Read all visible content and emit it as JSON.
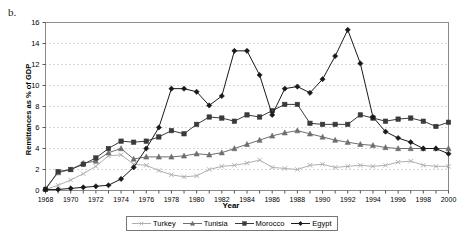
{
  "panel_label": "b.",
  "chart_data": {
    "type": "line",
    "title": "",
    "xlabel": "Year",
    "ylabel": "Remittances as % of GDP",
    "xlim": [
      1968,
      2000
    ],
    "ylim": [
      0,
      16
    ],
    "ytick_step": 2,
    "xtick_step": 2,
    "grid": true,
    "grid_style": "dotted-horizontal",
    "legend_position": "bottom-center",
    "x": [
      1968,
      1969,
      1970,
      1971,
      1972,
      1973,
      1974,
      1975,
      1976,
      1977,
      1978,
      1979,
      1980,
      1981,
      1982,
      1983,
      1984,
      1985,
      1986,
      1987,
      1988,
      1989,
      1990,
      1991,
      1992,
      1993,
      1994,
      1995,
      1996,
      1997,
      1998,
      1999,
      2000
    ],
    "ytick_labels": [
      "0",
      "2",
      "4",
      "6",
      "8",
      "10",
      "12",
      "14",
      "16"
    ],
    "xtick_labels": [
      "1968",
      "1970",
      "1972",
      "1974",
      "1976",
      "1978",
      "1980",
      "1982",
      "1984",
      "1986",
      "1988",
      "1990",
      "1992",
      "1994",
      "1996",
      "1998",
      "2000"
    ],
    "series": [
      {
        "name": "Turkey",
        "color": "#b0b0b0",
        "marker": "x",
        "values": [
          0.1,
          0.5,
          1.0,
          1.6,
          2.3,
          3.3,
          3.4,
          2.5,
          2.4,
          1.9,
          1.5,
          1.3,
          1.4,
          2.0,
          2.3,
          2.4,
          2.6,
          2.9,
          2.2,
          2.1,
          2.0,
          2.4,
          2.5,
          2.2,
          2.3,
          2.4,
          2.3,
          2.4,
          2.7,
          2.8,
          2.4,
          2.3,
          2.3
        ]
      },
      {
        "name": "Tunisia",
        "color": "#6e6e6e",
        "marker": "triangle",
        "values": [
          0.2,
          1.7,
          2.0,
          2.6,
          2.8,
          3.6,
          4.0,
          3.0,
          3.2,
          3.2,
          3.2,
          3.3,
          3.5,
          3.4,
          3.6,
          4.0,
          4.4,
          4.8,
          5.2,
          5.5,
          5.7,
          5.4,
          5.1,
          4.8,
          4.6,
          4.4,
          4.3,
          4.1,
          4.0,
          4.0,
          4.0,
          4.0,
          4.0
        ]
      },
      {
        "name": "Morocco",
        "color": "#3a3a3a",
        "marker": "square",
        "values": [
          0.1,
          1.8,
          2.0,
          2.5,
          3.1,
          4.0,
          4.7,
          4.6,
          4.7,
          5.1,
          5.7,
          5.4,
          6.3,
          7.0,
          6.9,
          6.6,
          7.2,
          7.0,
          7.6,
          8.2,
          8.2,
          6.4,
          6.3,
          6.3,
          6.3,
          7.2,
          6.9,
          6.6,
          6.8,
          6.9,
          6.6,
          6.1,
          6.5
        ]
      },
      {
        "name": "Egypt",
        "color": "#1a1a1a",
        "marker": "diamond",
        "values": [
          0.1,
          0.1,
          0.2,
          0.3,
          0.4,
          0.5,
          1.1,
          2.2,
          4.0,
          6.0,
          9.7,
          9.7,
          9.4,
          8.1,
          9.0,
          13.3,
          13.3,
          11.0,
          7.2,
          9.7,
          9.9,
          9.3,
          10.6,
          12.8,
          15.3,
          12.1,
          7.0,
          5.6,
          5.0,
          4.6,
          4.0,
          4.0,
          3.5
        ]
      }
    ]
  },
  "caption": ""
}
